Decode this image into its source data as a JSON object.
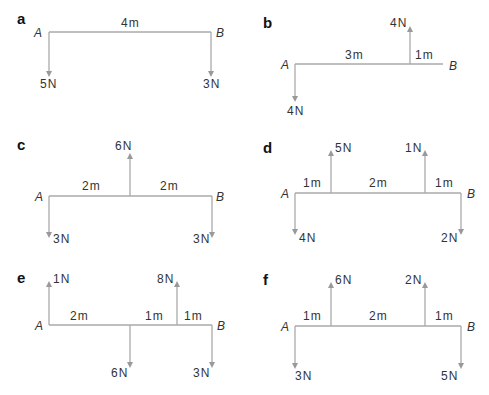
{
  "panels": [
    {
      "id": "a",
      "label": "a",
      "left_point": "A",
      "right_point": "B",
      "segments": [
        "4m"
      ],
      "forces": [
        {
          "position": "A",
          "magnitude": "5N",
          "direction": "down"
        },
        {
          "position": "B",
          "magnitude": "3N",
          "direction": "down"
        }
      ]
    },
    {
      "id": "b",
      "label": "b",
      "left_point": "A",
      "right_point": "B",
      "segments": [
        "3m",
        "1m"
      ],
      "forces": [
        {
          "position": "A",
          "magnitude": "4N",
          "direction": "down"
        },
        {
          "position": "3m from A",
          "magnitude": "4N",
          "direction": "up"
        }
      ]
    },
    {
      "id": "c",
      "label": "c",
      "left_point": "A",
      "right_point": "B",
      "segments": [
        "2m",
        "2m"
      ],
      "forces": [
        {
          "position": "A",
          "magnitude": "3N",
          "direction": "down"
        },
        {
          "position": "midpoint",
          "magnitude": "6N",
          "direction": "up"
        },
        {
          "position": "B",
          "magnitude": "3N",
          "direction": "down"
        }
      ]
    },
    {
      "id": "d",
      "label": "d",
      "left_point": "A",
      "right_point": "B",
      "segments": [
        "1m",
        "2m",
        "1m"
      ],
      "forces": [
        {
          "position": "A",
          "magnitude": "4N",
          "direction": "down"
        },
        {
          "position": "1m from A",
          "magnitude": "5N",
          "direction": "up"
        },
        {
          "position": "3m from A",
          "magnitude": "1N",
          "direction": "up"
        },
        {
          "position": "B",
          "magnitude": "2N",
          "direction": "down"
        }
      ]
    },
    {
      "id": "e",
      "label": "e",
      "left_point": "A",
      "right_point": "B",
      "segments": [
        "2m",
        "1m",
        "1m"
      ],
      "forces": [
        {
          "position": "A",
          "magnitude": "1N",
          "direction": "up"
        },
        {
          "position": "2m from A",
          "magnitude": "6N",
          "direction": "down"
        },
        {
          "position": "3m from A",
          "magnitude": "8N",
          "direction": "up"
        },
        {
          "position": "B",
          "magnitude": "3N",
          "direction": "down"
        }
      ]
    },
    {
      "id": "f",
      "label": "f",
      "left_point": "A",
      "right_point": "B",
      "segments": [
        "1m",
        "2m",
        "1m"
      ],
      "forces": [
        {
          "position": "A",
          "magnitude": "3N",
          "direction": "down"
        },
        {
          "position": "1m from A",
          "magnitude": "6N",
          "direction": "up"
        },
        {
          "position": "3m from A",
          "magnitude": "2N",
          "direction": "up"
        },
        {
          "position": "B",
          "magnitude": "5N",
          "direction": "down"
        }
      ]
    }
  ]
}
